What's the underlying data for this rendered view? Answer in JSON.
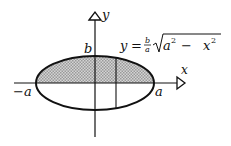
{
  "figure": {
    "type": "ellipse-area-diagram",
    "axes": {
      "x_label": "x",
      "y_label": "y"
    },
    "labels": {
      "b": "b",
      "neg_a": "−a",
      "a": "a"
    },
    "equation": {
      "lhs": "y",
      "equals": "=",
      "frac_num": "b",
      "frac_den": "a",
      "radicand_a": "a",
      "exp_a": "2",
      "minus": "−",
      "radicand_x": "x",
      "exp_x": "2"
    },
    "shaded_region": "upper half of ellipse",
    "colors": {
      "stroke": "#111111",
      "shade": "#bdbdbd",
      "background": "#ffffff"
    }
  }
}
